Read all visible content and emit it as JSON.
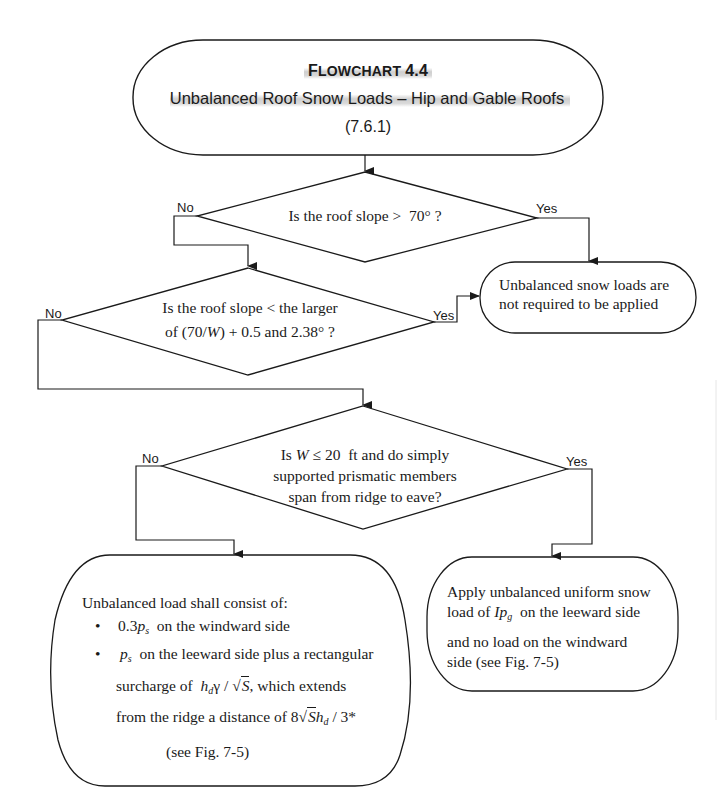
{
  "header": {
    "flowchart_label": "Flowchart 4.4",
    "flowchart_label_cap": "F",
    "flowchart_label_rest": "LOWCHART",
    "flowchart_number": "4.4",
    "title": "Unbalanced Roof Snow Loads – Hip and Gable Roofs",
    "section_ref": "(7.6.1)"
  },
  "decision_1": {
    "question": "Is the roof slope > 70° ?",
    "question_prefix": "Is the roof slope >",
    "question_value": "70",
    "question_suffix": "° ?",
    "no_label": "No",
    "yes_label": "Yes"
  },
  "decision_2": {
    "line1": "Is the roof slope < the larger",
    "line2_prefix": "of (70/",
    "line2_var": "W",
    "line2_mid": ") + 0.5 and",
    "line2_value": "2.38",
    "line2_suffix": "° ?",
    "no_label": "No",
    "yes_label": "Yes"
  },
  "decision_3": {
    "line1_prefix": "Is",
    "line1_var": "W",
    "line1_op": "≤ 20",
    "line1_suffix": "ft and do simply",
    "line2": "supported prismatic members",
    "line3": "span from ridge to eave?",
    "no_label": "No",
    "yes_label": "Yes"
  },
  "terminal_not_required": {
    "line1": "Unbalanced snow loads are",
    "line2": "not required to be applied"
  },
  "terminal_unbalanced_load": {
    "intro": "Unbalanced load shall consist of:",
    "bullet_glyph": "•",
    "bullet1_coef": "0.3",
    "bullet1_var": "p",
    "bullet1_sub": "s",
    "bullet1_text": "on the windward side",
    "bullet2_var": "p",
    "bullet2_sub": "s",
    "bullet2_text": "on the leeward side plus a rectangular",
    "bullet2_line2_prefix": "surcharge of",
    "bullet2_line2_h": "h",
    "bullet2_line2_hsub": "d",
    "bullet2_line2_gamma": "γ",
    "bullet2_line2_slash": " / ",
    "bullet2_line2_root": "√",
    "bullet2_line2_S": "S",
    "bullet2_line2_suffix": ", which extends",
    "bullet2_line3_prefix": "from the ridge a distance of",
    "bullet2_line3_8": "8",
    "bullet2_line3_root": "√",
    "bullet2_line3_S": "S",
    "bullet2_line3_h": "h",
    "bullet2_line3_hsub": "d",
    "bullet2_line3_suffix": " / 3*",
    "see_fig": "(see Fig. 7-5)"
  },
  "terminal_uniform_load": {
    "line1": "Apply unbalanced uniform snow",
    "line2_prefix": "load of",
    "line2_var_I": "Ip",
    "line2_sub": "g",
    "line2_suffix": "on the leeward side",
    "line3": "and no load on the windward",
    "line4": "side (see Fig. 7-5)"
  },
  "colors": {
    "stroke": "#1a1a1a",
    "background": "#ffffff",
    "title_highlight": "#d0d0d0"
  }
}
